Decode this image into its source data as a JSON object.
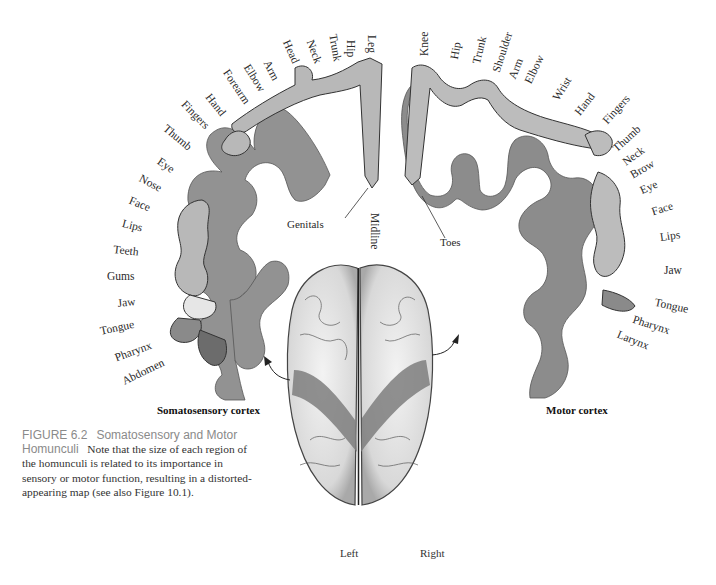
{
  "figure": {
    "caption": {
      "label": "FIGURE 6.2",
      "title": "Somatosensory and Motor Homunculi",
      "text": "Note that the size of each region of the homunculi is related to its importance in sensory or motor function, resulting in a distorted-appearing map (see also Figure 10.1)."
    },
    "panels": {
      "left_title": "Somatosensory cortex",
      "right_title": "Motor cortex"
    },
    "hemispheres": {
      "left": "Left",
      "right": "Right"
    },
    "midline": "Midline",
    "callouts": {
      "genitals": "Genitals",
      "toes": "Toes"
    },
    "somatosensory_labels": [
      "Leg",
      "Hip",
      "Trunk",
      "Neck",
      "Head",
      "Arm",
      "Elbow",
      "Forearm",
      "Hand",
      "Fingers",
      "Thumb",
      "Eye",
      "Nose",
      "Face",
      "Lips",
      "Teeth",
      "Gums",
      "Jaw",
      "Tongue",
      "Pharynx",
      "Abdomen"
    ],
    "motor_labels": [
      "Knee",
      "Hip",
      "Trunk",
      "Shoulder",
      "Arm",
      "Elbow",
      "Wrist",
      "Hand",
      "Fingers",
      "Thumb",
      "Neck",
      "Brow",
      "Eye",
      "Face",
      "Lips",
      "Jaw",
      "Tongue",
      "Pharynx",
      "Larynx"
    ],
    "colors": {
      "cortex_band": "#8f8f8f",
      "homunculus_fill": "#b4b4b4",
      "outline": "#2b2b2b",
      "caption_heading": "#8a8a8a"
    }
  }
}
